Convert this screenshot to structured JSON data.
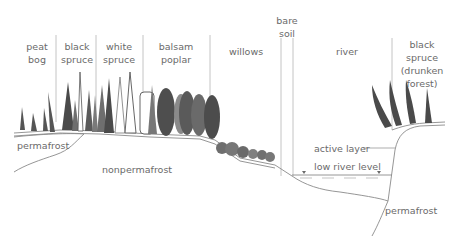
{
  "diagram": {
    "type": "ecological cross-section",
    "zones": [
      {
        "id": "peat-bog",
        "lines": [
          "peat",
          "bog"
        ],
        "x": 37
      },
      {
        "id": "black-spruce",
        "lines": [
          "black",
          "spruce"
        ],
        "x": 76
      },
      {
        "id": "white-spruce",
        "lines": [
          "white",
          "spruce"
        ],
        "x": 119
      },
      {
        "id": "balsam-poplar",
        "lines": [
          "balsam",
          "poplar"
        ],
        "x": 176
      },
      {
        "id": "willows",
        "lines": [
          "willows"
        ],
        "x": 246
      },
      {
        "id": "bare-soil",
        "lines": [
          "bare",
          "soil"
        ],
        "x": 287
      },
      {
        "id": "river",
        "lines": [
          "river"
        ],
        "x": 347
      },
      {
        "id": "black-spruce-drunken",
        "lines": [
          "black",
          "spruce",
          "(drunken",
          "forest)"
        ],
        "x": 421
      }
    ],
    "ground_labels": {
      "permafrost_left": "permafrost",
      "nonpermafrost": "nonpermafrost",
      "active_layer": "active layer",
      "low_river_level": "low river level",
      "permafrost_right": "permafrost"
    },
    "colors": {
      "line": "#8a8a8a",
      "text": "#6a6a6a",
      "tree_dark": "#4a4a4a",
      "tree_mid": "#6e6e6e",
      "tree_light": "#8c8c8c"
    }
  }
}
